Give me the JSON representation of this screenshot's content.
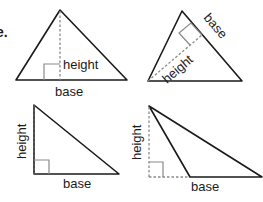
{
  "partial_text": "e.",
  "colors": {
    "edge": "#1a1a1a",
    "height_line": "#8a8a8a",
    "background": "#ffffff"
  },
  "triangles": [
    {
      "id": "acute",
      "height_label": "height",
      "base_label": "base",
      "description": "Height drawn from apex perpendicular to horizontal base, inside triangle"
    },
    {
      "id": "rotated",
      "height_label": "height",
      "base_label": "base",
      "description": "Base is the right slanted side; height drawn from opposite vertex perpendicular to it"
    },
    {
      "id": "right",
      "height_label": "height",
      "base_label": "base",
      "description": "Right triangle; height is the vertical leg"
    },
    {
      "id": "obtuse",
      "height_label": "height",
      "base_label": "base",
      "description": "Obtuse triangle; height falls outside, base extended with dashed line"
    }
  ]
}
